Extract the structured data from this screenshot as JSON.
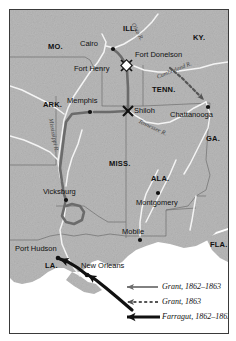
{
  "map": {
    "title": "Civil War Western Theater Campaign Map",
    "colors": {
      "land": "#b9b9b9",
      "water": "#ffffff",
      "border": "#3a3a3a",
      "state_line": "#6e6e6e",
      "river": "#f2f2f2",
      "route_grant": "#6b6b6b",
      "route_farragut": "#111111",
      "label": "#111111"
    },
    "states": [
      {
        "name": "MO.",
        "x": 38,
        "y": 36
      },
      {
        "name": "ILL.",
        "x": 113,
        "y": 18
      },
      {
        "name": "KY.",
        "x": 183,
        "y": 27
      },
      {
        "name": "TENN.",
        "x": 142,
        "y": 79
      },
      {
        "name": "ARK.",
        "x": 33,
        "y": 94
      },
      {
        "name": "MISS.",
        "x": 99,
        "y": 153
      },
      {
        "name": "ALA.",
        "x": 141,
        "y": 168
      },
      {
        "name": "GA.",
        "x": 196,
        "y": 128
      },
      {
        "name": "LA.",
        "x": 35,
        "y": 255
      },
      {
        "name": "FLA.",
        "x": 203,
        "y": 234
      }
    ],
    "cities": [
      {
        "name": "Cairo",
        "x": 78,
        "y": 33,
        "dot_x": 103,
        "dot_y": 39,
        "anchor": "right"
      },
      {
        "name": "Memphis",
        "x": 62,
        "y": 90,
        "dot_x": 80,
        "dot_y": 102,
        "anchor": "center"
      },
      {
        "name": "Chattanooga",
        "x": 170,
        "y": 104,
        "dot_x": 198,
        "dot_y": 97,
        "anchor": "left"
      },
      {
        "name": "Vicksburg",
        "x": 41,
        "y": 181,
        "dot_x": 56,
        "dot_y": 190,
        "anchor": "left"
      },
      {
        "name": "Montgomery",
        "x": 131,
        "y": 192,
        "dot_x": 148,
        "dot_y": 183,
        "anchor": "left"
      },
      {
        "name": "Mobile",
        "x": 118,
        "y": 221,
        "dot_x": 130,
        "dot_y": 230,
        "anchor": "left"
      },
      {
        "name": "Port Hudson",
        "x": 13,
        "y": 238,
        "dot_x": 47,
        "dot_y": 248,
        "anchor": "left"
      },
      {
        "name": "New Orleans",
        "x": 80,
        "y": 255,
        "dot_x": 77,
        "dot_y": 265,
        "anchor": "left"
      }
    ],
    "battles": [
      {
        "name": "Fort Donelson",
        "label_x": 125,
        "label_y": 44,
        "marker_x": 117,
        "marker_y": 56,
        "marker": "crossed-swords"
      },
      {
        "name": "Fort Henry",
        "label_x": 70,
        "label_y": 58,
        "marker_x": 116,
        "marker_y": 58,
        "marker": "crossed-swords"
      },
      {
        "name": "Shiloh",
        "label_x": 125,
        "label_y": 100,
        "marker_x": 118,
        "marker_y": 101,
        "marker": "x-battle"
      }
    ],
    "rivers": [
      {
        "name": "Ohio R.",
        "x": 131,
        "y": 14,
        "rotate": 62
      },
      {
        "name": "Cumberland R.",
        "x": 152,
        "y": 62,
        "rotate": 22
      },
      {
        "name": "Tennessee R.",
        "x": 140,
        "y": 112,
        "rotate": 25
      },
      {
        "name": "Mississippi R.",
        "x": 46,
        "y": 118,
        "rotate": 80
      }
    ],
    "legend": [
      {
        "label": "Grant, 1862–1863",
        "style": "thin-gray-arrow"
      },
      {
        "label": "Grant, 1863",
        "style": "dashed-gray-arrow"
      },
      {
        "label": "Farragut, 1862–1863",
        "style": "thick-black-arrow"
      }
    ]
  }
}
